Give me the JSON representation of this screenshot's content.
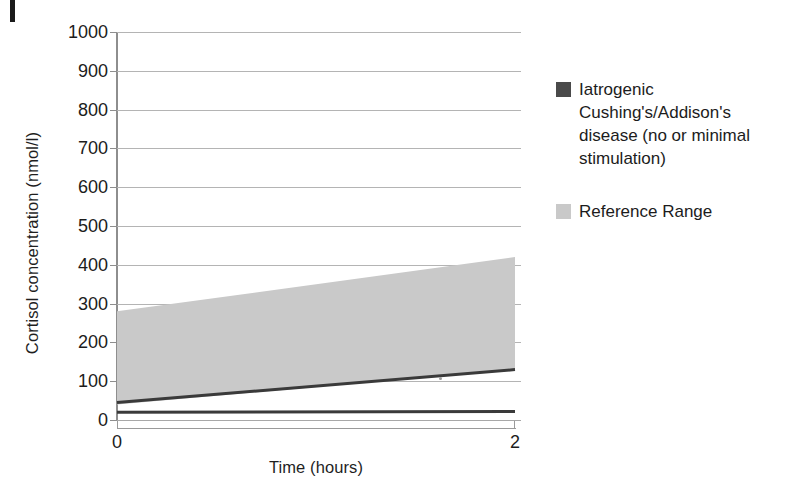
{
  "figure": {
    "page_edge_mark": "page-edge-artifact"
  },
  "chart_data": {
    "type": "area",
    "title": "",
    "xlabel": "Time (hours)",
    "ylabel": "Cortisol concentration (nmol/l)",
    "xlim": [
      0,
      2
    ],
    "ylim": [
      0,
      1000
    ],
    "x_ticks": [
      0,
      2
    ],
    "x_tick_labels": [
      "0",
      "2"
    ],
    "y_ticks": [
      0,
      100,
      200,
      300,
      400,
      500,
      600,
      700,
      800,
      900,
      1000
    ],
    "y_tick_labels": [
      "0",
      "100",
      "200",
      "300",
      "400",
      "500",
      "600",
      "700",
      "800",
      "900",
      "1000"
    ],
    "grid": true,
    "legend_position": "right",
    "x": [
      0,
      2
    ],
    "series": [
      {
        "name": "Reference Range",
        "kind": "band",
        "color": "#c9c9c9",
        "upper": [
          280,
          420
        ],
        "lower": [
          40,
          130
        ]
      },
      {
        "name": "Iatrogenic Cushing's/Addison's disease (no or minimal stimulation)",
        "kind": "line",
        "color": "#3a3a3a",
        "values": [
          20,
          22
        ]
      },
      {
        "name": "Reference range lower bound",
        "kind": "line",
        "color": "#3a3a3a",
        "values": [
          45,
          130
        ]
      }
    ]
  },
  "legend": {
    "entries": [
      {
        "label": "Iatrogenic Cushing's/Addison's disease (no or minimal stimulation)",
        "swatch_color": "#4a4a4a",
        "swatch_name": "legend-swatch-iatrogenic"
      },
      {
        "label": "Reference Range",
        "swatch_color": "#c9c9c9",
        "swatch_name": "legend-swatch-reference-range"
      }
    ]
  }
}
